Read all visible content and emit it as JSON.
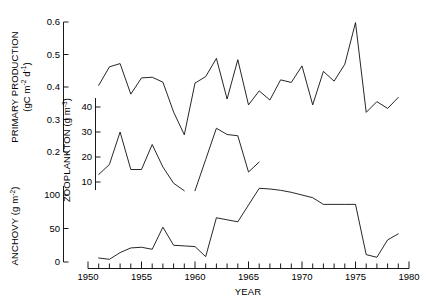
{
  "figure": {
    "background": "#ffffff",
    "line_color": "#000000",
    "xlabel": "YEAR"
  },
  "axes": {
    "primary_production": {
      "title_line1": "PRIMARY PRODUCTION",
      "title_line2_prefix": "(gC m",
      "title_line2_sup1": "-2",
      "title_line2_mid": " d",
      "title_line2_sup2": "-1",
      "title_line2_suffix": ")",
      "ticks": [
        "0.2",
        "0.3",
        "0.4",
        "0.5",
        "0.6"
      ],
      "range": [
        0.2,
        0.6
      ]
    },
    "zooplankton": {
      "title_prefix": "ZOOPLANKTON (g m",
      "title_sup": "-3",
      "title_suffix": ")",
      "ticks": [
        "10",
        "20",
        "30",
        "40"
      ],
      "range": [
        5,
        45
      ]
    },
    "anchovy": {
      "title_prefix": "ANCHOVY (g m",
      "title_sup": "-2",
      "title_suffix": ")",
      "ticks": [
        "0",
        "50",
        "100"
      ],
      "range": [
        0,
        125
      ]
    },
    "year": {
      "ticks": [
        "1950",
        "1955",
        "1960",
        "1965",
        "1970",
        "1975",
        "1980"
      ],
      "range": [
        1950,
        1980
      ],
      "minor_tick_step": 1
    }
  },
  "chart_data": {
    "type": "line",
    "title": "",
    "xlabel": "YEAR",
    "ylabel": "",
    "grid": false,
    "legend": "none",
    "xlim": [
      1950,
      1980
    ],
    "series": [
      {
        "name": "PRIMARY PRODUCTION",
        "unit": "gC m-2 d-1",
        "ylim": [
          0.2,
          0.6
        ],
        "axis": "primary_production",
        "x": [
          1951,
          1952,
          1953,
          1954,
          1955,
          1956,
          1957,
          1958,
          1959,
          1960,
          1961,
          1962,
          1963,
          1964,
          1965,
          1966,
          1967,
          1968,
          1969,
          1970,
          1971,
          1972,
          1973,
          1974,
          1975,
          1976,
          1977,
          1978,
          1979
        ],
        "values": [
          0.405,
          0.462,
          0.472,
          0.378,
          0.428,
          0.43,
          0.415,
          0.323,
          0.253,
          0.412,
          0.432,
          0.488,
          0.363,
          0.484,
          0.345,
          0.388,
          0.36,
          0.422,
          0.414,
          0.465,
          0.345,
          0.448,
          0.418,
          0.47,
          0.598,
          0.322,
          0.355,
          0.334,
          0.368
        ]
      },
      {
        "name": "ZOOPLANKTON",
        "unit": "g m-3",
        "ylim": [
          5,
          45
        ],
        "axis": "zooplankton",
        "segments": [
          {
            "x": [
              1951,
              1952,
              1953,
              1954,
              1955,
              1956,
              1957,
              1958,
              1959
            ],
            "values": [
              13.0,
              17.0,
              30.0,
              15.0,
              15.0,
              25.0,
              16.0,
              9.5,
              6.5
            ]
          },
          {
            "x": [
              1960,
              1961,
              1962,
              1963,
              1964,
              1965,
              1966
            ],
            "values": [
              6.5,
              19.0,
              31.5,
              29.0,
              28.5,
              14.0,
              18.0
            ]
          }
        ]
      },
      {
        "name": "ANCHOVY",
        "unit": "g m-2",
        "ylim": [
          0,
          125
        ],
        "axis": "anchovy",
        "x": [
          1951,
          1952,
          1953,
          1954,
          1955,
          1956,
          1957,
          1958,
          1959,
          1960,
          1961,
          1962,
          1963,
          1964,
          1965,
          1966,
          1967,
          1968,
          1969,
          1970,
          1971,
          1972,
          1973,
          1974,
          1975,
          1976,
          1977,
          1978,
          1979
        ],
        "values": [
          6,
          4,
          14,
          21,
          22,
          19,
          52,
          25,
          24,
          23,
          8,
          66,
          63,
          60,
          85,
          110,
          109,
          107,
          104,
          100,
          96,
          86,
          86,
          86,
          86,
          11,
          7,
          33,
          42
        ]
      }
    ]
  }
}
